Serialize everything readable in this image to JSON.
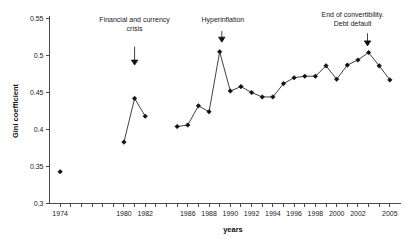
{
  "chart_data": {
    "type": "line",
    "title": "",
    "xlabel": "years",
    "ylabel": "Gini coefficient",
    "xlim": [
      1973,
      2006
    ],
    "ylim": [
      0.3,
      0.55
    ],
    "grid": false,
    "legend": "none",
    "marker": "filled-diamond",
    "y_ticks": [
      0.3,
      0.35,
      0.4,
      0.45,
      0.5,
      0.55
    ],
    "y_tick_labels": [
      "0.3",
      "0.35",
      "0.4",
      "0.45",
      "0.5",
      "0.55"
    ],
    "x_ticks": [
      1974,
      1975,
      1976,
      1977,
      1978,
      1979,
      1980,
      1981,
      1982,
      1983,
      1984,
      1985,
      1986,
      1987,
      1988,
      1989,
      1990,
      1991,
      1992,
      1993,
      1994,
      1995,
      1996,
      1997,
      1998,
      1999,
      2000,
      2001,
      2002,
      2003,
      2004,
      2005
    ],
    "x_tick_labels": [
      "1974",
      "",
      "",
      "",
      "",
      "",
      "1980",
      "",
      "1982",
      "",
      "",
      "",
      "1986",
      "",
      "1988",
      "",
      "1990",
      "",
      "1992",
      "",
      "1994",
      "",
      "1996",
      "",
      "1998",
      "",
      "2000",
      "",
      "2002",
      "",
      "",
      "2005"
    ],
    "segments": [
      {
        "name": "1974",
        "x": [
          1974
        ],
        "y": [
          0.343
        ]
      },
      {
        "name": "1980-1982",
        "x": [
          1980,
          1981,
          1982
        ],
        "y": [
          0.383,
          0.442,
          0.418
        ]
      },
      {
        "name": "1985-2005",
        "x": [
          1985,
          1986,
          1987,
          1988,
          1989,
          1990,
          1991,
          1992,
          1993,
          1994,
          1995,
          1996,
          1997,
          1998,
          1999,
          2000,
          2001,
          2002,
          2003,
          2004,
          2005
        ],
        "y": [
          0.404,
          0.406,
          0.432,
          0.424,
          0.505,
          0.452,
          0.458,
          0.45,
          0.444,
          0.444,
          0.462,
          0.47,
          0.472,
          0.472,
          0.486,
          0.468,
          0.487,
          0.494,
          0.504,
          0.486,
          0.467
        ]
      }
    ],
    "annotations": [
      {
        "id": "financial-crisis",
        "lines": [
          "Financial and currency",
          "crisis"
        ],
        "text_x": 1981,
        "text_y": 0.545,
        "arrow_x": 1981,
        "arrow_top_y": 0.512,
        "arrow_tip_y": 0.487
      },
      {
        "id": "hyperinflation",
        "lines": [
          "Hyperinflation"
        ],
        "text_x": 1989.3,
        "text_y": 0.545,
        "arrow_x": 1989.2,
        "arrow_top_y": 0.533,
        "arrow_tip_y": 0.518
      },
      {
        "id": "end-of-convertibility",
        "lines": [
          "End of convertibility.",
          "Debt default"
        ],
        "text_x": 2001.5,
        "text_y": 0.552,
        "arrow_x": 2002.9,
        "arrow_top_y": 0.53,
        "arrow_tip_y": 0.513
      }
    ]
  }
}
